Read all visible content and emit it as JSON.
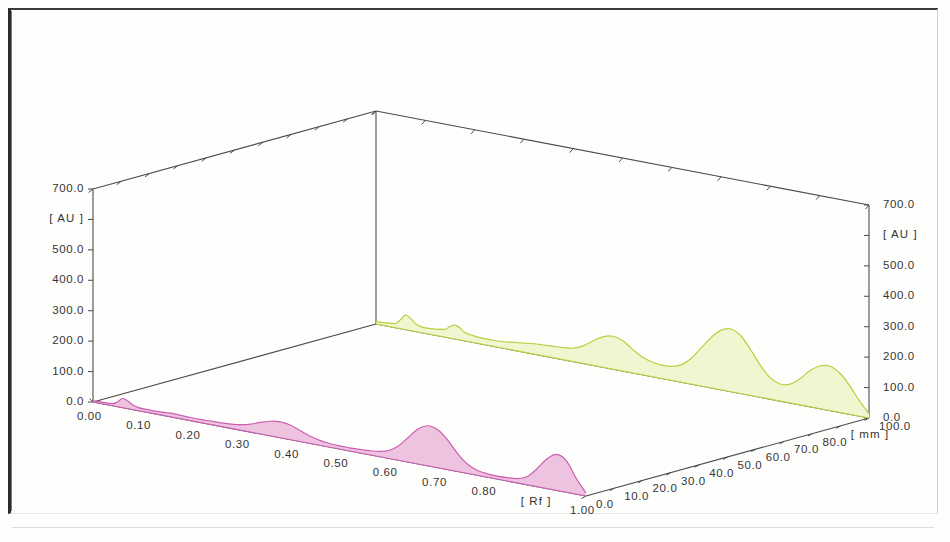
{
  "figure": {
    "kind": "3d-densitogram",
    "background_color": "#fefefd",
    "frame_color": "#2b2b2b"
  },
  "chart_data": {
    "type": "line",
    "title": "",
    "subtitle": "",
    "projection": "3D",
    "grid": false,
    "legend_position": "none",
    "xlabel": "[ Rf ]",
    "ylabel": "[ mm ]",
    "zlabel": "[ AU ]",
    "xlim": [
      0.0,
      1.0
    ],
    "ylim": [
      0.0,
      100.0
    ],
    "zlim": [
      0.0,
      700.0
    ],
    "x_ticklabels": [
      "0.00",
      "0.10",
      "0.20",
      "0.30",
      "0.40",
      "0.50",
      "0.60",
      "0.70",
      "0.80",
      "[ Rf ]",
      "1.00"
    ],
    "x_tickvalues": [
      0.0,
      0.1,
      0.2,
      0.3,
      0.4,
      0.5,
      0.6,
      0.7,
      0.8,
      0.9,
      1.0
    ],
    "y_ticklabels": [
      "0.0",
      "10.0",
      "20.0",
      "30.0",
      "40.0",
      "50.0",
      "60.0",
      "70.0",
      "80.0",
      "[ mm ]",
      "100.0"
    ],
    "y_tickvalues": [
      0.0,
      10.0,
      20.0,
      30.0,
      40.0,
      50.0,
      60.0,
      70.0,
      80.0,
      90.0,
      100.0
    ],
    "z_ticklabels_left": [
      "700.0",
      "[ AU ]",
      "500.0",
      "400.0",
      "300.0",
      "200.0",
      "100.0",
      "0.0"
    ],
    "z_ticklabels_right": [
      "700.0",
      "[ AU ]",
      "500.0",
      "400.0",
      "300.0",
      "200.0",
      "100.0",
      "0.0"
    ],
    "z_tickvalues": [
      700.0,
      600.0,
      500.0,
      400.0,
      300.0,
      200.0,
      100.0,
      0.0
    ],
    "series": [
      {
        "name": "track-back",
        "track_mm": 100.0,
        "line_color": "#b9cf3f",
        "fill_color": "#f1f6d0",
        "x": [
          0.0,
          0.02,
          0.04,
          0.05,
          0.06,
          0.07,
          0.08,
          0.09,
          0.1,
          0.12,
          0.14,
          0.15,
          0.16,
          0.17,
          0.18,
          0.2,
          0.22,
          0.24,
          0.26,
          0.28,
          0.3,
          0.32,
          0.34,
          0.36,
          0.38,
          0.4,
          0.42,
          0.44,
          0.46,
          0.48,
          0.5,
          0.52,
          0.54,
          0.56,
          0.58,
          0.6,
          0.62,
          0.64,
          0.66,
          0.68,
          0.7,
          0.72,
          0.74,
          0.76,
          0.78,
          0.8,
          0.82,
          0.84,
          0.86,
          0.88,
          0.9,
          0.92,
          0.94,
          0.96,
          0.98,
          1.0
        ],
        "values": [
          8,
          10,
          14,
          30,
          48,
          40,
          26,
          20,
          18,
          20,
          26,
          38,
          46,
          40,
          28,
          22,
          20,
          20,
          22,
          26,
          30,
          34,
          36,
          38,
          40,
          44,
          58,
          80,
          100,
          108,
          100,
          78,
          58,
          48,
          44,
          46,
          58,
          86,
          126,
          166,
          196,
          206,
          190,
          150,
          104,
          70,
          56,
          62,
          86,
          118,
          140,
          146,
          130,
          96,
          52,
          14
        ]
      },
      {
        "name": "track-front",
        "track_mm": 0.0,
        "line_color": "#cc5fb2",
        "fill_color": "#edc3e0",
        "x": [
          0.0,
          0.02,
          0.04,
          0.05,
          0.06,
          0.07,
          0.08,
          0.09,
          0.1,
          0.12,
          0.14,
          0.15,
          0.16,
          0.17,
          0.18,
          0.2,
          0.22,
          0.24,
          0.26,
          0.28,
          0.3,
          0.32,
          0.34,
          0.36,
          0.38,
          0.4,
          0.42,
          0.44,
          0.46,
          0.48,
          0.5,
          0.52,
          0.54,
          0.56,
          0.58,
          0.6,
          0.62,
          0.64,
          0.66,
          0.68,
          0.7,
          0.72,
          0.74,
          0.76,
          0.78,
          0.8,
          0.82,
          0.84,
          0.86,
          0.88,
          0.9,
          0.92,
          0.94,
          0.96,
          0.98,
          1.0
        ],
        "values": [
          4,
          5,
          7,
          16,
          30,
          26,
          16,
          11,
          9,
          9,
          10,
          11,
          12,
          12,
          11,
          10,
          10,
          11,
          12,
          14,
          18,
          26,
          38,
          48,
          52,
          48,
          36,
          24,
          16,
          12,
          10,
          10,
          11,
          13,
          17,
          26,
          48,
          82,
          116,
          132,
          124,
          96,
          58,
          30,
          16,
          11,
          10,
          11,
          14,
          26,
          58,
          96,
          118,
          104,
          52,
          10
        ]
      }
    ]
  },
  "axes": {
    "z_left": {
      "name": "absorbance-axis-left",
      "ticks": [
        "700.0",
        "[ AU ]",
        "500.0",
        "400.0",
        "300.0",
        "200.0",
        "100.0",
        "0.0"
      ]
    },
    "z_right": {
      "name": "absorbance-axis-right",
      "ticks": [
        "700.0",
        "[ AU ]",
        "500.0",
        "400.0",
        "300.0",
        "200.0",
        "100.0",
        "0.0"
      ]
    },
    "x_axis": {
      "name": "rf-axis",
      "ticks": [
        "0.00",
        "0.10",
        "0.20",
        "0.30",
        "0.40",
        "0.50",
        "0.60",
        "0.70",
        "0.80",
        "[ Rf ]",
        "1.00"
      ]
    },
    "y_axis": {
      "name": "mm-axis",
      "ticks": [
        "0.0",
        "10.0",
        "20.0",
        "30.0",
        "40.0",
        "50.0",
        "60.0",
        "70.0",
        "80.0",
        "[ mm ]",
        "100.0"
      ]
    }
  }
}
